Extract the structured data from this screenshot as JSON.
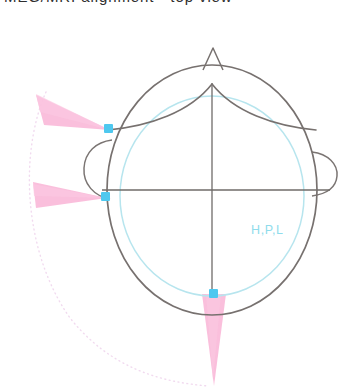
{
  "figure": {
    "title_clipped": "MEG/MRI alignment - top view",
    "hpi_label": "H,P,L",
    "background_color": "#ffffff"
  },
  "colors": {
    "head_outline": "#77716f",
    "helmet_ellipse": "#b9e6ee",
    "axis_line": "#6f6b69",
    "coil_marker": "#4ec8ef",
    "cone_fill": "#f9b9d8",
    "dotted_arc": "#f3dff0",
    "hpi_text": "#8fdcec"
  },
  "head": {
    "outline_name": "head-outline",
    "nose_name": "nose-marker",
    "hairline_name": "hairline-curve",
    "left_ear_name": "left-ear",
    "right_ear_name": "right-ear",
    "center_x": 212,
    "center_y": 190,
    "radius_x": 105,
    "radius_y": 125
  },
  "helmet": {
    "label": "H,P,L",
    "center_x": 212,
    "center_y": 195,
    "radius_x": 92,
    "radius_y": 100
  },
  "axes": {
    "vertical_label": "vertical-axis",
    "horizontal_label": "horizontal-axis",
    "crosshair_x": 212,
    "crosshair_y": 190
  },
  "coils": [
    {
      "name": "hpi-coil-1",
      "label": "H",
      "x": 108,
      "y": 128,
      "cone_direction": "upper-left",
      "cone_tip_x": 38,
      "cone_tip_y": 99,
      "cone_spread": 28
    },
    {
      "name": "hpi-coil-2",
      "label": "P",
      "x": 105,
      "y": 196,
      "cone_direction": "left",
      "cone_tip_x": 33,
      "cone_tip_y": 205,
      "cone_spread": 22
    },
    {
      "name": "hpi-coil-3",
      "label": "L",
      "x": 213,
      "y": 293,
      "cone_direction": "down",
      "cone_tip_x": 213,
      "cone_tip_y": 385,
      "cone_spread": 20
    }
  ],
  "dotted_arc": {
    "name": "digitization-arc",
    "style": "dotted",
    "color": "#f3dff0"
  }
}
